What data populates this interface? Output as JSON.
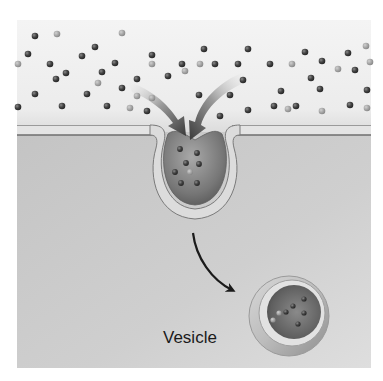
{
  "figure": {
    "labels": {
      "vesicle": "Vesicle"
    },
    "colors": {
      "extracellular": "#f0f0f0",
      "cytoplasm": "#c9c9c9",
      "membrane_dark": "#8a8a8a",
      "membrane_light": "#e2e2e2",
      "particle_dark": "#4a4a4a",
      "particle_light": "#a8a8a8",
      "arrow": "#1a1a1a",
      "text": "#1a1a1a"
    },
    "regions": {
      "extracellular_fluid": {
        "x": 17,
        "y": 20,
        "w": 354,
        "h": 108
      },
      "plasma_membrane_y": 131,
      "cytoplasm": {
        "x": 17,
        "y": 135,
        "w": 354,
        "h": 233
      }
    },
    "invagination": {
      "cx": 195,
      "cy": 168,
      "r": 33
    },
    "vesicle": {
      "cx": 289,
      "cy": 316,
      "r": 40,
      "label_x": 163,
      "label_y": 337
    },
    "particles_outside": [
      [
        35,
        36,
        "d"
      ],
      [
        57,
        34,
        "l"
      ],
      [
        28,
        54,
        "d"
      ],
      [
        18,
        64,
        "l"
      ],
      [
        50,
        64,
        "d"
      ],
      [
        56,
        79,
        "d"
      ],
      [
        66,
        73,
        "d"
      ],
      [
        82,
        56,
        "d"
      ],
      [
        95,
        47,
        "d"
      ],
      [
        102,
        72,
        "d"
      ],
      [
        115,
        63,
        "d"
      ],
      [
        122,
        33,
        "l"
      ],
      [
        98,
        83,
        "l"
      ],
      [
        122,
        88,
        "d"
      ],
      [
        137,
        79,
        "d"
      ],
      [
        152,
        55,
        "d"
      ],
      [
        152,
        64,
        "l"
      ],
      [
        168,
        76,
        "d"
      ],
      [
        182,
        64,
        "d"
      ],
      [
        185,
        71,
        "l"
      ],
      [
        204,
        49,
        "d"
      ],
      [
        200,
        64,
        "l"
      ],
      [
        215,
        64,
        "d"
      ],
      [
        238,
        64,
        "d"
      ],
      [
        248,
        49,
        "d"
      ],
      [
        243,
        80,
        "d"
      ],
      [
        199,
        95,
        "d"
      ],
      [
        230,
        95,
        "d"
      ],
      [
        270,
        64,
        "d"
      ],
      [
        292,
        64,
        "l"
      ],
      [
        305,
        52,
        "d"
      ],
      [
        322,
        61,
        "d"
      ],
      [
        311,
        78,
        "d"
      ],
      [
        338,
        69,
        "l"
      ],
      [
        348,
        53,
        "d"
      ],
      [
        355,
        70,
        "d"
      ],
      [
        366,
        46,
        "l"
      ],
      [
        370,
        62,
        "l"
      ],
      [
        281,
        91,
        "d"
      ],
      [
        320,
        89,
        "d"
      ],
      [
        35,
        94,
        "d"
      ],
      [
        62,
        106,
        "d"
      ],
      [
        87,
        94,
        "d"
      ],
      [
        107,
        106,
        "d"
      ],
      [
        137,
        96,
        "l"
      ],
      [
        147,
        111,
        "d"
      ],
      [
        130,
        108,
        "l"
      ],
      [
        152,
        98,
        "l"
      ],
      [
        220,
        116,
        "d"
      ],
      [
        248,
        110,
        "d"
      ],
      [
        274,
        106,
        "d"
      ],
      [
        288,
        109,
        "l"
      ],
      [
        296,
        106,
        "d"
      ],
      [
        322,
        111,
        "l"
      ],
      [
        350,
        105,
        "d"
      ],
      [
        367,
        108,
        "l"
      ],
      [
        367,
        90,
        "d"
      ],
      [
        18,
        107,
        "d"
      ]
    ],
    "particles_invagination": [
      [
        180,
        149,
        "d"
      ],
      [
        197,
        153,
        "d"
      ],
      [
        186,
        163,
        "d"
      ],
      [
        199,
        164,
        "d"
      ],
      [
        175,
        172,
        "d"
      ],
      [
        190,
        172,
        "l"
      ],
      [
        181,
        183,
        "d"
      ],
      [
        197,
        183,
        "d"
      ]
    ],
    "particles_vesicle": [
      [
        304,
        299,
        "d"
      ],
      [
        293,
        306,
        "d"
      ],
      [
        304,
        313,
        "d"
      ],
      [
        279,
        313,
        "l"
      ],
      [
        273,
        320,
        "l"
      ],
      [
        286,
        312,
        "d"
      ],
      [
        298,
        324,
        "d"
      ]
    ]
  }
}
